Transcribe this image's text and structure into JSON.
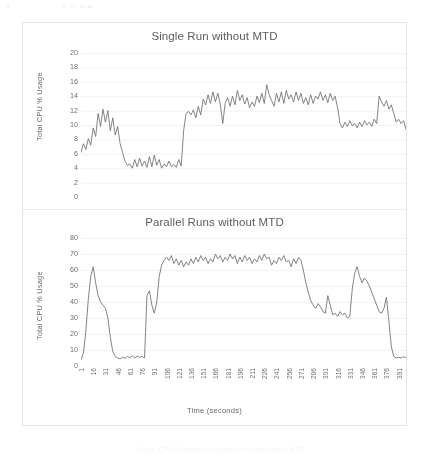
{
  "page_header": {
    "page_number": "4",
    "running_head": "C. D. et al."
  },
  "figure_caption": "Figure. CPU Utilization Comparison with and without MTD",
  "colors": {
    "data_line": "#6e6e70",
    "gridline": "#eceded",
    "border": "#e2e2e4",
    "text": "#5d5d5f"
  },
  "chart_data": [
    {
      "type": "line",
      "title": "Single Run without MTD",
      "xlabel": "Time (seconds)",
      "ylabel": "Total CPU % Usage",
      "ylim": [
        0,
        20
      ],
      "yticks": [
        0,
        2,
        4,
        6,
        8,
        10,
        12,
        14,
        16,
        18,
        20
      ],
      "xlim": [
        1,
        400
      ],
      "xticks": [
        1,
        16,
        31,
        46,
        61,
        76,
        91,
        106,
        121,
        136,
        151,
        166,
        181,
        196,
        211,
        226,
        241,
        256,
        271,
        286,
        301,
        316,
        331,
        346,
        361,
        376,
        391
      ],
      "grid": true,
      "legend": "none",
      "x": [
        1,
        4,
        7,
        10,
        13,
        16,
        19,
        22,
        25,
        28,
        31,
        34,
        37,
        40,
        43,
        46,
        49,
        52,
        55,
        58,
        61,
        64,
        67,
        70,
        73,
        76,
        79,
        82,
        85,
        88,
        91,
        94,
        97,
        100,
        103,
        106,
        109,
        112,
        115,
        118,
        121,
        124,
        127,
        130,
        133,
        136,
        139,
        142,
        145,
        148,
        151,
        154,
        157,
        160,
        163,
        166,
        169,
        172,
        175,
        178,
        181,
        184,
        187,
        190,
        193,
        196,
        199,
        202,
        205,
        208,
        211,
        214,
        217,
        220,
        223,
        226,
        229,
        232,
        235,
        238,
        241,
        244,
        247,
        250,
        253,
        256,
        259,
        262,
        265,
        268,
        271,
        274,
        277,
        280,
        283,
        286,
        289,
        292,
        295,
        298,
        301,
        304,
        307,
        310,
        313,
        316,
        319,
        322,
        325,
        328,
        331,
        334,
        337,
        340,
        343,
        346,
        349,
        352,
        355,
        358,
        361,
        364,
        367,
        370,
        373,
        376,
        379,
        382,
        385,
        388,
        391,
        394,
        397,
        400
      ],
      "values": [
        6.2,
        7.4,
        6.6,
        8.1,
        7.2,
        9.6,
        8.4,
        11.6,
        9.8,
        12.2,
        10.4,
        12.0,
        9.2,
        11.0,
        8.6,
        9.8,
        7.4,
        6.2,
        5.0,
        4.4,
        4.6,
        4.0,
        5.2,
        4.2,
        5.4,
        4.3,
        5.0,
        4.1,
        5.6,
        4.2,
        5.8,
        4.4,
        5.2,
        4.0,
        4.6,
        4.2,
        5.0,
        4.2,
        4.5,
        4.1,
        5.2,
        4.3,
        9.2,
        11.6,
        11.9,
        11.4,
        12.1,
        11.0,
        12.6,
        11.4,
        13.6,
        12.8,
        14.2,
        13.0,
        14.6,
        13.2,
        14.4,
        12.9,
        10.2,
        13.0,
        13.8,
        12.6,
        14.0,
        12.8,
        14.8,
        13.4,
        14.2,
        12.9,
        13.8,
        12.4,
        13.2,
        12.6,
        14.0,
        13.1,
        14.4,
        13.0,
        15.6,
        14.2,
        13.4,
        12.6,
        14.4,
        13.2,
        14.6,
        13.0,
        14.8,
        13.6,
        14.2,
        13.2,
        14.6,
        13.4,
        14.4,
        13.0,
        13.8,
        12.8,
        14.2,
        13.0,
        14.0,
        13.6,
        14.6,
        13.4,
        14.2,
        13.1,
        14.4,
        13.4,
        14.0,
        12.4,
        10.2,
        9.6,
        10.4,
        9.8,
        10.6,
        9.9,
        10.2,
        9.6,
        10.4,
        9.8,
        10.6,
        10.0,
        10.4,
        9.8,
        10.8,
        10.2,
        14.0,
        13.2,
        12.6,
        13.4,
        12.2,
        12.8,
        11.6,
        10.4,
        10.8,
        10.2,
        10.6,
        9.4,
        5.2,
        4.4
      ]
    },
    {
      "type": "line",
      "title": "Parallel Runs without MTD",
      "xlabel": "Time (seconds)",
      "ylabel": "Total CPU % Usage",
      "ylim": [
        0,
        80
      ],
      "yticks": [
        0,
        10,
        20,
        30,
        40,
        50,
        60,
        70,
        80
      ],
      "xlim": [
        1,
        400
      ],
      "xticks": [
        1,
        16,
        31,
        46,
        61,
        76,
        91,
        106,
        121,
        136,
        151,
        166,
        181,
        196,
        211,
        226,
        241,
        256,
        271,
        286,
        301,
        316,
        331,
        346,
        361,
        376,
        391
      ],
      "grid": true,
      "legend": "none",
      "x": [
        1,
        4,
        7,
        10,
        13,
        16,
        19,
        22,
        25,
        28,
        31,
        34,
        37,
        40,
        43,
        46,
        49,
        52,
        55,
        58,
        61,
        64,
        67,
        70,
        73,
        76,
        79,
        82,
        85,
        88,
        91,
        94,
        97,
        100,
        103,
        106,
        109,
        112,
        115,
        118,
        121,
        124,
        127,
        130,
        133,
        136,
        139,
        142,
        145,
        148,
        151,
        154,
        157,
        160,
        163,
        166,
        169,
        172,
        175,
        178,
        181,
        184,
        187,
        190,
        193,
        196,
        199,
        202,
        205,
        208,
        211,
        214,
        217,
        220,
        223,
        226,
        229,
        232,
        235,
        238,
        241,
        244,
        247,
        250,
        253,
        256,
        259,
        262,
        265,
        268,
        271,
        274,
        277,
        280,
        283,
        286,
        289,
        292,
        295,
        298,
        301,
        304,
        307,
        310,
        313,
        316,
        319,
        322,
        325,
        328,
        331,
        334,
        337,
        340,
        343,
        346,
        349,
        352,
        355,
        358,
        361,
        364,
        367,
        370,
        373,
        376,
        379,
        382,
        385,
        388,
        391,
        394,
        397,
        400
      ],
      "values": [
        4.0,
        8.0,
        22.0,
        42.0,
        56.0,
        62.0,
        52.0,
        44.0,
        40.0,
        38.0,
        36.0,
        30.0,
        18.0,
        9.0,
        6.0,
        5.0,
        4.5,
        5.5,
        4.8,
        6.0,
        5.2,
        6.4,
        5.0,
        6.2,
        5.4,
        6.0,
        5.0,
        44.0,
        47.0,
        38.0,
        33.0,
        40.0,
        56.0,
        63.0,
        66.0,
        68.0,
        66.0,
        69.0,
        64.0,
        67.0,
        63.0,
        66.0,
        62.0,
        65.0,
        63.0,
        67.0,
        64.0,
        68.0,
        65.0,
        69.0,
        66.0,
        68.0,
        64.0,
        67.0,
        65.0,
        70.0,
        67.0,
        69.0,
        65.0,
        68.0,
        66.0,
        70.0,
        67.0,
        69.0,
        64.0,
        68.0,
        65.0,
        69.0,
        66.0,
        68.0,
        64.0,
        67.0,
        65.0,
        69.0,
        66.0,
        70.0,
        67.0,
        68.0,
        63.0,
        66.0,
        64.0,
        68.0,
        66.0,
        69.0,
        65.0,
        66.0,
        62.0,
        67.0,
        64.0,
        68.0,
        66.0,
        60.0,
        52.0,
        46.0,
        41.0,
        38.0,
        36.0,
        39.0,
        37.0,
        34.0,
        33.0,
        44.0,
        38.0,
        32.0,
        33.0,
        31.0,
        34.0,
        32.0,
        33.0,
        30.0,
        31.0,
        48.0,
        58.0,
        62.0,
        56.0,
        52.0,
        55.0,
        53.0,
        50.0,
        46.0,
        42.0,
        38.0,
        34.0,
        33.0,
        36.0,
        43.0,
        28.0,
        12.0,
        6.0,
        5.0,
        5.5,
        5.0,
        5.8,
        5.2,
        5.6
      ]
    }
  ]
}
